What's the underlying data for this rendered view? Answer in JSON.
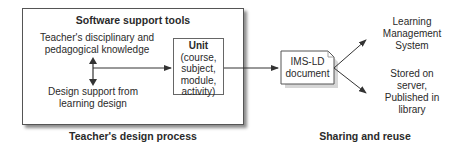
{
  "diagram": {
    "main_box": {
      "title": "Software support tools",
      "knowledge_line1": "Teacher's disciplinary and",
      "knowledge_line2": "pedagogical knowledge",
      "design_line1": "Design support from",
      "design_line2": "learning design",
      "unit": {
        "title": "Unit",
        "line1": "(course,",
        "line2": "subject,",
        "line3": "module,",
        "line4": "activity)"
      }
    },
    "document": {
      "line1": "IMS-LD",
      "line2": "document"
    },
    "destinations": {
      "lms": [
        "Learning",
        "Management",
        "System"
      ],
      "stored": [
        "Stored on",
        "server,",
        "Published in",
        "library"
      ]
    },
    "captions": {
      "left": "Teacher's design process",
      "right": "Sharing and reuse"
    },
    "colors": {
      "line": "#333333",
      "text": "#2a2a2a",
      "background": "#ffffff"
    }
  }
}
